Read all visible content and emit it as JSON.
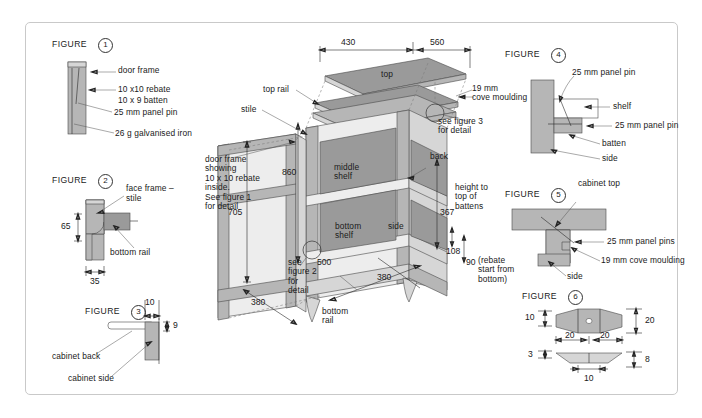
{
  "sheet": {
    "title": ""
  },
  "figures": [
    {
      "id": "1",
      "label": "FIGURE",
      "number": "1",
      "callouts": [
        "door frame",
        "10 x10 rebate",
        "10 x 9 batten",
        "25 mm panel pin",
        "26 g galvanised iron"
      ]
    },
    {
      "id": "2",
      "label": "FIGURE",
      "number": "2",
      "callouts": [
        "face frame –",
        "stile",
        "bottom rail"
      ],
      "dims": [
        "65",
        "35"
      ]
    },
    {
      "id": "3",
      "label": "FIGURE",
      "number": "3",
      "callouts": [
        "cabinet back",
        "cabinet side"
      ],
      "dims": [
        "10",
        "9"
      ]
    },
    {
      "id": "4",
      "label": "FIGURE",
      "number": "4",
      "callouts": [
        "25 mm panel pin",
        "shelf",
        "25 mm panel pin",
        "batten",
        "side"
      ]
    },
    {
      "id": "5",
      "label": "FIGURE",
      "number": "5",
      "callouts": [
        "cabinet top",
        "25 mm panel pins",
        "19 mm cove moulding",
        "side"
      ]
    },
    {
      "id": "6",
      "label": "FIGURE",
      "number": "6",
      "dims": [
        "10",
        "20",
        "20",
        "20",
        "3",
        "8",
        "10"
      ]
    }
  ],
  "main": {
    "parts": {
      "top": "top",
      "top_rail": "top rail",
      "stile": "stile",
      "middle_shelf": "middle\nshelf",
      "bottom_shelf": "bottom\nshelf",
      "side": "side",
      "back": "back",
      "bottom_rail": "bottom\nrail"
    },
    "dimensions": {
      "width_left": "430",
      "width_right": "560",
      "height_860": "860",
      "height_705": "705",
      "depth_380_left": "380",
      "depth_380_right": "380",
      "height_367": "367",
      "dim_108": "108",
      "dim_90": "90",
      "dim_500": "500"
    },
    "notes": {
      "door_frame_note": "door frame\nshowing\n10 x 10 rebate\ninside.\nSee figure 1\nfor detail",
      "cove_note": "19 mm\ncove moulding",
      "see_fig3": "see figure 3\nfor detail",
      "see_fig2": "see\nfigure 2\nfor\ndetail",
      "battens_note": "height to\ntop of\nbattens",
      "rebate_note": "(rebate\nstart from\nbottom)"
    }
  },
  "colors": {
    "panel_dark": "#9a9a9a",
    "panel_mid": "#b6b6b6",
    "panel_light": "#d6d6d6",
    "panel_pale": "#ededed",
    "line": "#2a2a2a",
    "frame_border": "#c9c9c9"
  }
}
